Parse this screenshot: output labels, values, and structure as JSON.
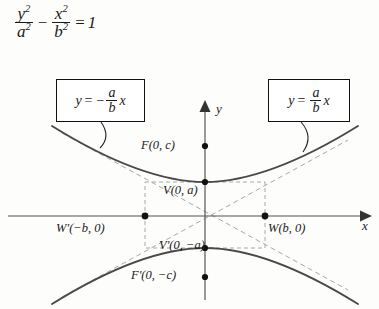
{
  "figure": {
    "type": "conic-section-diagram",
    "conic": "hyperbola",
    "orientation": "vertical-transverse-axis",
    "equation": {
      "numerator_1": "y",
      "exponent_1": "2",
      "denominator_1": "a",
      "denominator_exponent_1": "2",
      "operator": "−",
      "numerator_2": "x",
      "exponent_2": "2",
      "denominator_2": "b",
      "denominator_exponent_2": "2",
      "equals": "=",
      "rhs": "1"
    },
    "callouts": [
      {
        "id": "asymptote-negative",
        "lhs": "y",
        "equals": "=",
        "sign": "−",
        "num": "a",
        "den": "b",
        "var": "x"
      },
      {
        "id": "asymptote-positive",
        "lhs": "y",
        "equals": "=",
        "sign": "",
        "num": "a",
        "den": "b",
        "var": "x"
      }
    ],
    "points": {
      "focus_upper": "F(0, c)",
      "focus_lower": "F′(0, −c)",
      "vertex_upper": "V(0, a)",
      "vertex_lower": "V′(0, −a)",
      "w_right": "W(b, 0)",
      "w_left": "W′(−b, 0)"
    },
    "axes": {
      "y_label": "y",
      "x_label": "x"
    },
    "colors": {
      "background": "#fdfdfb",
      "ink": "#1a1a1a",
      "curve": "#4a4a4a",
      "axis": "#555555",
      "dashed": "#9a9a9a",
      "box_border": "#111111"
    }
  }
}
